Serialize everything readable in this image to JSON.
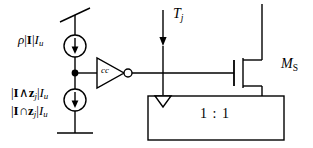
{
  "diagram": {
    "type": "circuit-schematic",
    "background_color": "#ffffff",
    "line_color": "#000000",
    "width": 313,
    "height": 148
  },
  "labels": {
    "source_top": {
      "text": "ρ|I|I_u",
      "rho": "ρ",
      "bar_left": "|",
      "set_I": "I",
      "bar_right": "|",
      "current_unit": "I",
      "current_unit_sub": "u"
    },
    "source_bottom_line1": {
      "text": "|I∧z_j|I_u",
      "bar_left": "|",
      "set_I": "I",
      "operator": "∧",
      "vector_z": "z",
      "vector_z_sub": "j",
      "bar_right": "|",
      "current_unit": "I",
      "current_unit_sub": "u"
    },
    "source_bottom_line2": {
      "text": "|I∩z_j|I_u",
      "bar_left": "|",
      "set_I": "I",
      "operator": "∩",
      "vector_z": "z",
      "vector_z_sub": "j",
      "bar_right": "|",
      "current_unit": "I",
      "current_unit_sub": "u"
    },
    "inverter_label": "cc",
    "current_tj": {
      "text": "T_j",
      "symbol": "T",
      "subscript": "j"
    },
    "transistor": {
      "text": "M_S",
      "symbol": "M",
      "subscript": "S"
    },
    "mirror_ratio": "1 : 1"
  },
  "components": {
    "supply_rail": "supply-rail-symbol",
    "ground": "ground-symbol",
    "current_source_top": "current-source-top",
    "current_source_bottom": "current-source-bottom",
    "junction_node": "junction-dot",
    "inverter": "inverter-cc",
    "inverter_bubble": "inverter-output-bubble",
    "mosfet": "mosfet-ms",
    "current_mirror_box": "current-mirror-1-1",
    "mirror_input_arrow": "mirror-input-arrow",
    "tj_arrow": "tj-current-arrow"
  }
}
